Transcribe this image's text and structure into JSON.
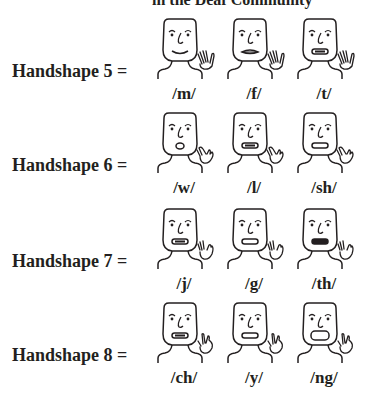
{
  "header": {
    "title_fragment": "in the Deaf Community"
  },
  "rows": [
    {
      "label": "Handshape 5 =",
      "hand": "five",
      "items": [
        {
          "phoneme": "/m/",
          "mouth": "smile"
        },
        {
          "phoneme": "/f/",
          "mouth": "lip-bite"
        },
        {
          "phoneme": "/t/",
          "mouth": "teeth-dark"
        }
      ]
    },
    {
      "label": "Handshape 6 =",
      "hand": "six",
      "items": [
        {
          "phoneme": "/w/",
          "mouth": "round-small"
        },
        {
          "phoneme": "/l/",
          "mouth": "teeth-dark"
        },
        {
          "phoneme": "/sh/",
          "mouth": "oval-flat"
        }
      ]
    },
    {
      "label": "Handshape 7 =",
      "hand": "seven",
      "items": [
        {
          "phoneme": "/j/",
          "mouth": "teeth-dark"
        },
        {
          "phoneme": "/g/",
          "mouth": "oval-flat"
        },
        {
          "phoneme": "/th/",
          "mouth": "dark-fill"
        }
      ]
    },
    {
      "label": "Handshape 8 =",
      "hand": "eight",
      "items": [
        {
          "phoneme": "/ch/",
          "mouth": "teeth-dark"
        },
        {
          "phoneme": "/y/",
          "mouth": "oval-flat"
        },
        {
          "phoneme": "/ng/",
          "mouth": "open-wide"
        }
      ]
    }
  ]
}
